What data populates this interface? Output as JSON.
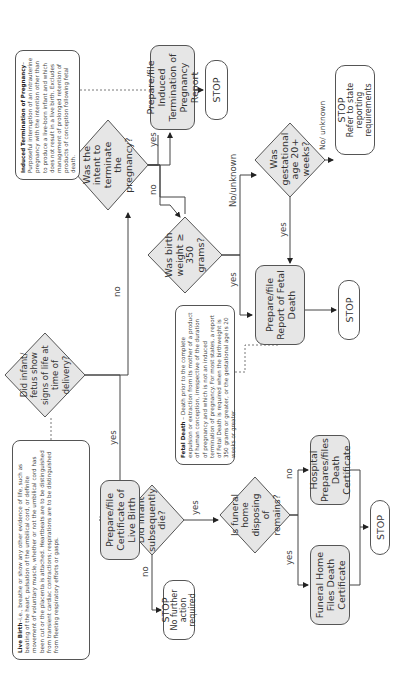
{
  "notes": {
    "live_birth": {
      "term": "Live Birth",
      "text": "–i.e., breathe or show any other evidence of life, such as beating of the heart, pulsation of the umbilical cord, or definite movement of voluntary muscle, whether or not the umbilical cord has been cut or the placenta is attached. Heartbeats are to be distinguished from transient cardiac contractions; respirations are to be distinguished from fleeting respiratory efforts or gasps."
    },
    "induced_termination": {
      "term": "Induced Termination of Pregnancy",
      "text": "–Purposeful interruption of an intrauterine pregnancy with the intention other than to produce a live-born infant and which does not result in a live birth. Excludes management of prolonged retention of products of conception following fetal death."
    },
    "fetal_death": {
      "term": "Fetal Death",
      "text": " – Death prior to the complete expulsion or extraction from its mother of a product of human conception, irrespective of the duration of pregnancy and which is not an induced termination of pregnancy. For most states, a report of Fetal Death is required when the birthweight is 350 grams or greater, or the gestational age is 20 weeks or greater."
    }
  },
  "decisions": {
    "signs_of_life": "Did infant/ fetus show signs of life at time of delivery?",
    "intent_terminate": "Was the intent to terminate the pregnancy?",
    "birth_weight": "Was birth weight ≥ 350 grams?",
    "gestational_age": "Was gestational age 20+ weeks?",
    "subsequently_die": "Did infant subsequently die?",
    "funeral_home": "Is funeral home disposing of remains?"
  },
  "actions": {
    "induced_report": "Prepare/file Induced Termination of Pregnancy Report",
    "fetal_death_report": "Prepare/file Report of Fetal Death",
    "live_birth_cert": "Prepare/file Certificate of Live Birth",
    "funeral_home_files": "Funeral Home Files Death Certificate",
    "hospital_prepares": "Hospital Prepares/files Death Certificate"
  },
  "stops": {
    "after_induced": "STOP",
    "refer_state_title": "STOP",
    "refer_state_text": "Refer to state reporting requirements",
    "after_fetal": "STOP",
    "no_further_title": "STOP",
    "no_further_text": "No further action required",
    "after_death_cert": "STOP"
  },
  "edge_labels": {
    "signs_no": "no",
    "signs_yes": "yes",
    "intent_yes": "yes",
    "intent_no": "no",
    "weight_yes": "yes",
    "weight_no": "No/unknown",
    "gest_yes": "yes",
    "gest_no": "No/ unknown",
    "die_no": "no",
    "die_yes": "yes",
    "funeral_yes": "yes",
    "funeral_no": "no"
  },
  "colors": {
    "box_fill": "#e6e6e6",
    "stroke": "#555555",
    "text": "#333333"
  }
}
